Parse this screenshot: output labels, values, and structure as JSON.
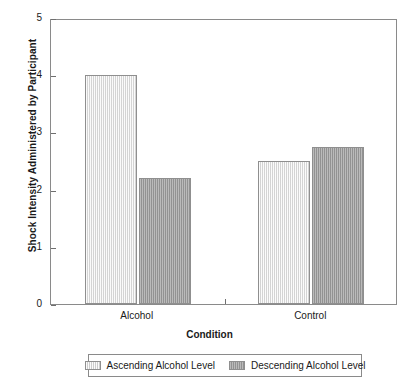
{
  "chart_data": {
    "type": "bar",
    "title": "",
    "xlabel": "Condition",
    "ylabel": "Shock Intensity Administered by Participant",
    "categories": [
      "Alcohol",
      "Control"
    ],
    "series": [
      {
        "name": "Ascending Alcohol Level",
        "values": [
          4.0,
          2.5
        ],
        "color": "#e2e2e2"
      },
      {
        "name": "Descending Alcohol Level",
        "values": [
          2.2,
          2.75
        ],
        "color": "#9d9d9d"
      }
    ],
    "ylim": [
      0,
      5
    ],
    "yticks": [
      "0",
      "1",
      "2",
      "3",
      "4",
      "5"
    ],
    "grid": false,
    "legend_position": "bottom"
  }
}
